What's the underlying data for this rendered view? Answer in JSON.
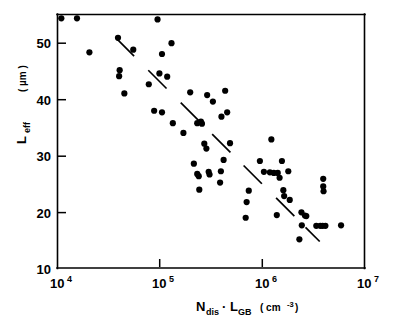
{
  "chart_data": {
    "type": "scatter",
    "title": "",
    "xlabel": "N_dis · L_GB  (cm⁻³)",
    "ylabel": "L_eff  (µm)",
    "xscale": "log",
    "yscale": "linear",
    "xlim": [
      10000,
      10000000
    ],
    "ylim": [
      8.0,
      55.0
    ],
    "grid": false,
    "legend": null,
    "x_tick_labels": [
      "10⁴",
      "10⁵",
      "10⁶",
      "10⁷"
    ],
    "x_tick_values": [
      10000,
      100000,
      1000000,
      10000000
    ],
    "y_tick_labels": [
      "10",
      "20",
      "30",
      "40",
      "50"
    ],
    "y_tick_values": [
      10,
      20,
      30,
      40,
      50
    ],
    "marker": "filled-circle",
    "marker_color": "#000000",
    "marker_diameter_px": 6.2,
    "points": [
      [
        10900,
        54.2
      ],
      [
        15500,
        54.2
      ],
      [
        95000,
        54.0
      ],
      [
        20500,
        47.9
      ],
      [
        39000,
        50.6
      ],
      [
        55000,
        48.4
      ],
      [
        105000,
        47.6
      ],
      [
        130000,
        49.6
      ],
      [
        40500,
        44.6
      ],
      [
        40000,
        43.5
      ],
      [
        99000,
        44.0
      ],
      [
        118000,
        43.4
      ],
      [
        78000,
        42.0
      ],
      [
        45000,
        40.3
      ],
      [
        198000,
        40.5
      ],
      [
        290000,
        40.0
      ],
      [
        435000,
        40.8
      ],
      [
        330000,
        38.8
      ],
      [
        88000,
        37.1
      ],
      [
        105000,
        36.8
      ],
      [
        400000,
        36.0
      ],
      [
        455000,
        36.8
      ],
      [
        134000,
        34.8
      ],
      [
        232000,
        34.8
      ],
      [
        252000,
        35.1
      ],
      [
        258000,
        34.7
      ],
      [
        170000,
        33.0
      ],
      [
        272000,
        31.0
      ],
      [
        485000,
        31.1
      ],
      [
        1230000,
        31.8
      ],
      [
        285000,
        30.1
      ],
      [
        215000,
        27.3
      ],
      [
        420000,
        28.0
      ],
      [
        950000,
        27.8
      ],
      [
        1560000,
        27.8
      ],
      [
        232000,
        25.4
      ],
      [
        240000,
        25.0
      ],
      [
        300000,
        25.8
      ],
      [
        306000,
        25.3
      ],
      [
        395000,
        25.9
      ],
      [
        1040000,
        25.8
      ],
      [
        1190000,
        25.7
      ],
      [
        1300000,
        25.6
      ],
      [
        1420000,
        25.6
      ],
      [
        1800000,
        25.9
      ],
      [
        1480000,
        24.7
      ],
      [
        388000,
        23.8
      ],
      [
        3950000,
        24.5
      ],
      [
        3950000,
        23.1
      ],
      [
        3980000,
        22.2
      ],
      [
        243000,
        22.5
      ],
      [
        740000,
        22.3
      ],
      [
        1610000,
        22.4
      ],
      [
        705000,
        20.2
      ],
      [
        1640000,
        21.3
      ],
      [
        1860000,
        20.6
      ],
      [
        1390000,
        17.8
      ],
      [
        2420000,
        18.3
      ],
      [
        2620000,
        17.7
      ],
      [
        2700000,
        17.6
      ],
      [
        690000,
        17.3
      ],
      [
        2440000,
        15.9
      ],
      [
        3380000,
        15.8
      ],
      [
        3700000,
        15.8
      ],
      [
        3900000,
        15.8
      ],
      [
        4150000,
        15.8
      ],
      [
        5900000,
        15.9
      ],
      [
        2310000,
        13.3
      ]
    ],
    "trend_line": {
      "style": "dashed",
      "x_start": 38000,
      "y_start": 50.4,
      "x_end": 3650000,
      "y_end": 12.9
    }
  },
  "axis_titles": {
    "y_main": "L",
    "y_sub": "eff",
    "y_unit": "( µm )",
    "x_main_1": "N",
    "x_sub_1": "dis",
    "x_dot": "·",
    "x_main_2": "L",
    "x_sub_2": "GB",
    "x_unit_open": "( cm",
    "x_unit_sup": "-3",
    "x_unit_close": ")"
  },
  "exponent_labels": {
    "base": "10",
    "exps": [
      "4",
      "5",
      "6",
      "7"
    ]
  }
}
